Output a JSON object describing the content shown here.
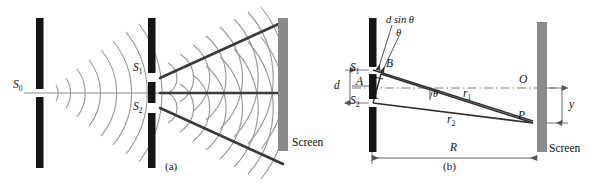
{
  "figure": {
    "background_color": "#ffffff",
    "width": 595,
    "height": 193,
    "panel_captions": {
      "a": "(a)",
      "b": "(b)"
    }
  },
  "colors": {
    "barrier_black": "#151515",
    "screen_gray": "#8a8a8a",
    "wavefront_gray": "#9a9a9a",
    "ray_dark": "#3a3a3a",
    "axis_gray": "#8d8d8d",
    "text": "#111111",
    "dimension_line": "#555555"
  },
  "panel_a": {
    "caption": "(a)",
    "labels": {
      "source_slit": "S",
      "source_slit_sub": "0",
      "slit_1": "S",
      "slit_1_sub": "1",
      "slit_2": "S",
      "slit_2_sub": "2",
      "screen": "Screen"
    },
    "elements": {
      "single_slit_barrier": "vertical black barrier with single slit S0",
      "double_slit_barrier": "vertical black barrier with two slits S1 and S2",
      "incoming_wavefronts": "circular wavefronts spreading from S0",
      "interference_wavefronts": "overlapping circular wavefronts from S1 and S2",
      "antinodal_lines": "dark radiating lines marking constructive interference directions",
      "viewing_screen": "gray vertical screen at right"
    },
    "geometry": {
      "barrier_1_x": 40,
      "barrier_2_x": 152,
      "screen_x": 283,
      "axis_y": 93,
      "slit_1_y": 78,
      "slit_2_y": 108
    }
  },
  "panel_b": {
    "caption": "(b)",
    "labels": {
      "path_difference": "d sin θ",
      "angle_theta_top": "θ",
      "angle_theta_axis": "θ",
      "point_B": "B",
      "point_A": "A",
      "slit_1": "S",
      "slit_1_sub": "1",
      "slit_2": "S",
      "slit_2_sub": "2",
      "slit_separation": "d",
      "ray_1": "r",
      "ray_1_sub": "1",
      "ray_2": "r",
      "ray_2_sub": "2",
      "center_point_O": "O",
      "point_P": "P",
      "screen_distance": "R",
      "fringe_position": "y",
      "screen": "Screen"
    },
    "elements": {
      "slit_barrier": "vertical black double-slit barrier",
      "viewing_screen": "gray vertical screen at right",
      "central_axis": "horizontal dash-dot axis from A to O",
      "ray_r1": "line from S1 to P",
      "ray_r2": "line from S2 to P",
      "path_difference_segment": "short segment S2-B equal to d sin theta",
      "d_dimension": "vertical dimension line between S1 and S2",
      "R_dimension": "horizontal dimension line from barrier to screen",
      "y_dimension": "vertical dimension line from O to P"
    },
    "geometry": {
      "barrier_x": 370,
      "screen_x": 540,
      "axis_y": 88,
      "slit_1_y": 70,
      "slit_2_y": 103,
      "point_A_y": 86,
      "point_P_y": 122,
      "point_O_y": 88
    }
  }
}
